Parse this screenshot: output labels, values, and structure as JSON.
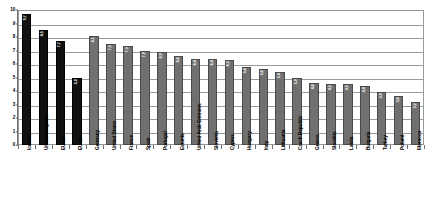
{
  "chart_data": {
    "type": "bar",
    "title": "",
    "xlabel": "",
    "ylabel": "",
    "ylim": [
      0,
      10
    ],
    "yticks": [
      0,
      1,
      2,
      3,
      4,
      5,
      6,
      7,
      8,
      9,
      10
    ],
    "grid": true,
    "legend": false,
    "categories": [
      "Iceland",
      "United Kingdom",
      "EU-15",
      "EU-25",
      "Germany",
      "United States",
      "France",
      "Spain",
      "Portugal",
      "Estonia",
      "United Arab Emirates",
      "Slovenia",
      "Cyprus",
      "Hungary",
      "Italy",
      "Lithuania",
      "Czech Republic",
      "Greece",
      "Slovakia",
      "Latvia",
      "Bulgaria",
      "Turkey",
      "Poland",
      "Morocco"
    ],
    "values": [
      9.7,
      8.5,
      7.7,
      5.0,
      8.1,
      7.5,
      7.3,
      7.0,
      6.9,
      6.6,
      6.4,
      6.4,
      6.3,
      5.8,
      5.6,
      5.4,
      5.0,
      4.6,
      4.5,
      4.5,
      4.4,
      3.9,
      3.6,
      3.2
    ],
    "bar_labels": [
      "9,7",
      "8,5",
      "7,7",
      "5,0",
      "8,1",
      "7,5",
      "7,3",
      "7,0",
      "6,9",
      "6,6",
      "6,4",
      "6,4",
      "6,3",
      "5,8",
      "5,6",
      "5,4",
      "5,0",
      "4,6",
      "4,5",
      "4,5",
      "4,4",
      "3,9",
      "3,6",
      "3,2"
    ],
    "series_colors": [
      "#111111",
      "#111111",
      "#111111",
      "#111111",
      "#707070",
      "#707070",
      "#707070",
      "#707070",
      "#707070",
      "#707070",
      "#707070",
      "#707070",
      "#707070",
      "#707070",
      "#707070",
      "#707070",
      "#707070",
      "#707070",
      "#707070",
      "#707070",
      "#707070",
      "#707070",
      "#707070",
      "#707070"
    ],
    "colors": {
      "highlight_bar": "#111111",
      "normal_bar": "#707070",
      "gridline": "#9a9a9a",
      "axis": "#6f6f6f",
      "background": "#ffffff",
      "label_text": "#000000",
      "value_text": "#ffffff"
    }
  }
}
